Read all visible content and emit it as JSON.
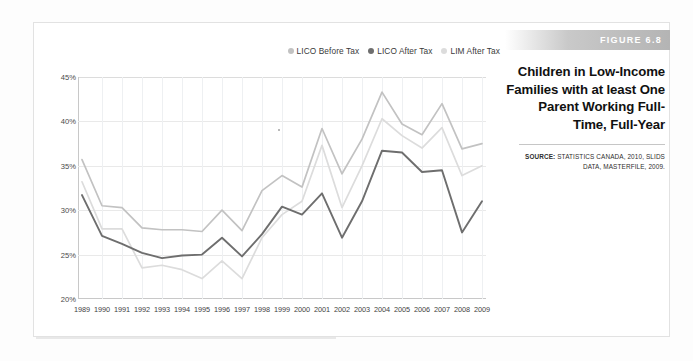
{
  "figure": {
    "tag": "FIGURE 6.8",
    "title": "Children in Low-Income Families with at least One Parent Working Full-Time, Full-Year",
    "source_label": "SOURCE:",
    "source_text": "STATISTICS CANADA, 2010, SLIDS DATA, MASTERFILE, 2009."
  },
  "colors": {
    "lico_before_tax": "#c2c2c2",
    "lico_after_tax": "#6e6e6e",
    "lim_after_tax": "#dcdcdc",
    "grid": "#e9e9e9",
    "axis": "#c8c8c8",
    "tag_bar": "#b4b4b4"
  },
  "chart_data": {
    "type": "line",
    "title": "Children in Low-Income Families with at least One Parent Working Full-Time, Full-Year",
    "xlabel": "",
    "ylabel": "",
    "ylim": [
      20,
      45
    ],
    "yticks": [
      "20%",
      "25%",
      "30%",
      "35%",
      "40%",
      "45%"
    ],
    "ytick_values": [
      20,
      25,
      30,
      35,
      40,
      45
    ],
    "grid": true,
    "legend_position": "top-right",
    "value_suffix": "%",
    "x": [
      1989,
      1990,
      1991,
      1992,
      1993,
      1994,
      1995,
      1996,
      1997,
      1998,
      1999,
      2000,
      2001,
      2002,
      2003,
      2004,
      2005,
      2006,
      2007,
      2008,
      2009
    ],
    "categories": [
      "1989",
      "1990",
      "1991",
      "1992",
      "1993",
      "1994",
      "1995",
      "1996",
      "1997",
      "1998",
      "1999",
      "2000",
      "2001",
      "2002",
      "2003",
      "2004",
      "2005",
      "2006",
      "2007",
      "2008",
      "2009"
    ],
    "series": [
      {
        "name": "LICO Before Tax",
        "color": "#c2c2c2",
        "values": [
          35.7,
          30.5,
          30.3,
          28.0,
          27.8,
          27.8,
          27.6,
          30.0,
          27.7,
          32.2,
          33.9,
          32.6,
          39.2,
          34.1,
          38.0,
          43.3,
          39.7,
          38.5,
          42.0,
          36.9,
          37.5
        ]
      },
      {
        "name": "LICO After Tax",
        "color": "#6e6e6e",
        "values": [
          31.7,
          27.1,
          26.2,
          25.2,
          24.6,
          24.9,
          25.0,
          26.9,
          24.8,
          27.3,
          30.4,
          29.5,
          31.9,
          26.9,
          31.0,
          36.7,
          36.5,
          34.3,
          34.5,
          27.5,
          31.0
        ]
      },
      {
        "name": "LIM After Tax",
        "color": "#dcdcdc",
        "values": [
          33.2,
          27.9,
          27.9,
          23.5,
          23.8,
          23.3,
          22.3,
          24.3,
          22.3,
          26.9,
          29.5,
          31.0,
          37.3,
          30.3,
          35.0,
          40.3,
          38.4,
          37.0,
          39.3,
          33.9,
          35.0
        ]
      }
    ]
  }
}
